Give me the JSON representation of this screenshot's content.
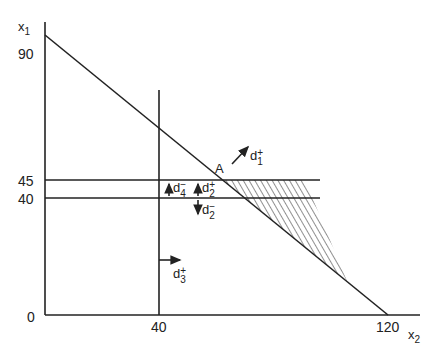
{
  "diagram": {
    "type": "goal-programming-graph",
    "axes": {
      "y_label": "x",
      "y_label_sub": "1",
      "x_label": "x",
      "x_label_sub": "2",
      "origin": "0",
      "y_ticks": [
        "90",
        "45",
        "40"
      ],
      "x_ticks": [
        "40",
        "120"
      ]
    },
    "point_label": "A",
    "deviations": [
      {
        "id": "d1p",
        "base": "d",
        "sup": "+",
        "sub": "1"
      },
      {
        "id": "d2p",
        "base": "d",
        "sup": "+",
        "sub": "2"
      },
      {
        "id": "d2m",
        "base": "d",
        "sup": "−",
        "sub": "2"
      },
      {
        "id": "d4m",
        "base": "d",
        "sup": "−",
        "sub": "4"
      },
      {
        "id": "d3p",
        "base": "d",
        "sup": "+",
        "sub": "3"
      }
    ],
    "lines": [
      {
        "name": "x1 + 0.75x2 = 90",
        "from": [
          0,
          90
        ],
        "to": [
          120,
          0
        ]
      },
      {
        "name": "x2 = 40"
      },
      {
        "name": "x1 = 45"
      },
      {
        "name": "x1 = 40"
      }
    ],
    "stroke_color": "#222222",
    "hatch_region": "feasible-shaded"
  }
}
